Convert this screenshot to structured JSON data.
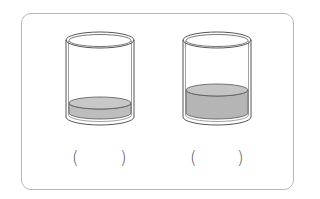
{
  "figure": {
    "frame_border_color": "#b8b8b8",
    "water_color": "#bdbdbd",
    "glass_outline_color": "#555555",
    "glasses": [
      {
        "id": "left",
        "water_level": "low",
        "answer_open": "(",
        "answer_close": ")",
        "answer": ""
      },
      {
        "id": "right",
        "water_level": "higher",
        "answer_open": "(",
        "answer_close": ")",
        "answer": ""
      }
    ]
  }
}
